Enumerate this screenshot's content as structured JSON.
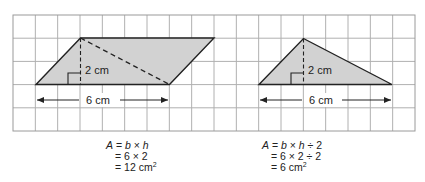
{
  "grid": {
    "columns": 18,
    "rows": 5,
    "line_color": "#b0b0b0",
    "border_color": "#9a9a9a"
  },
  "colors": {
    "shape_fill": "#d2d2d2",
    "shape_stroke": "#222222",
    "text": "#222222"
  },
  "parallelogram": {
    "height_label": "2 cm",
    "base_label": "6 cm",
    "formula": {
      "line1_prefix": "A",
      "line1_rest": " = ",
      "line1_b": "b",
      "line1_times": " × ",
      "line1_h": "h",
      "line2": "= 6 × 2",
      "line3": "= 12 cm",
      "line3_sup": "2"
    }
  },
  "triangle": {
    "height_label": "2 cm",
    "base_label": "6 cm",
    "formula": {
      "line1_prefix": "A",
      "line1_rest": " = ",
      "line1_b": "b",
      "line1_times": " × ",
      "line1_h": "h",
      "line1_div": " ÷ 2",
      "line2": "= 6 × 2 ÷ 2",
      "line3": "= 6 cm",
      "line3_sup": "2"
    }
  }
}
